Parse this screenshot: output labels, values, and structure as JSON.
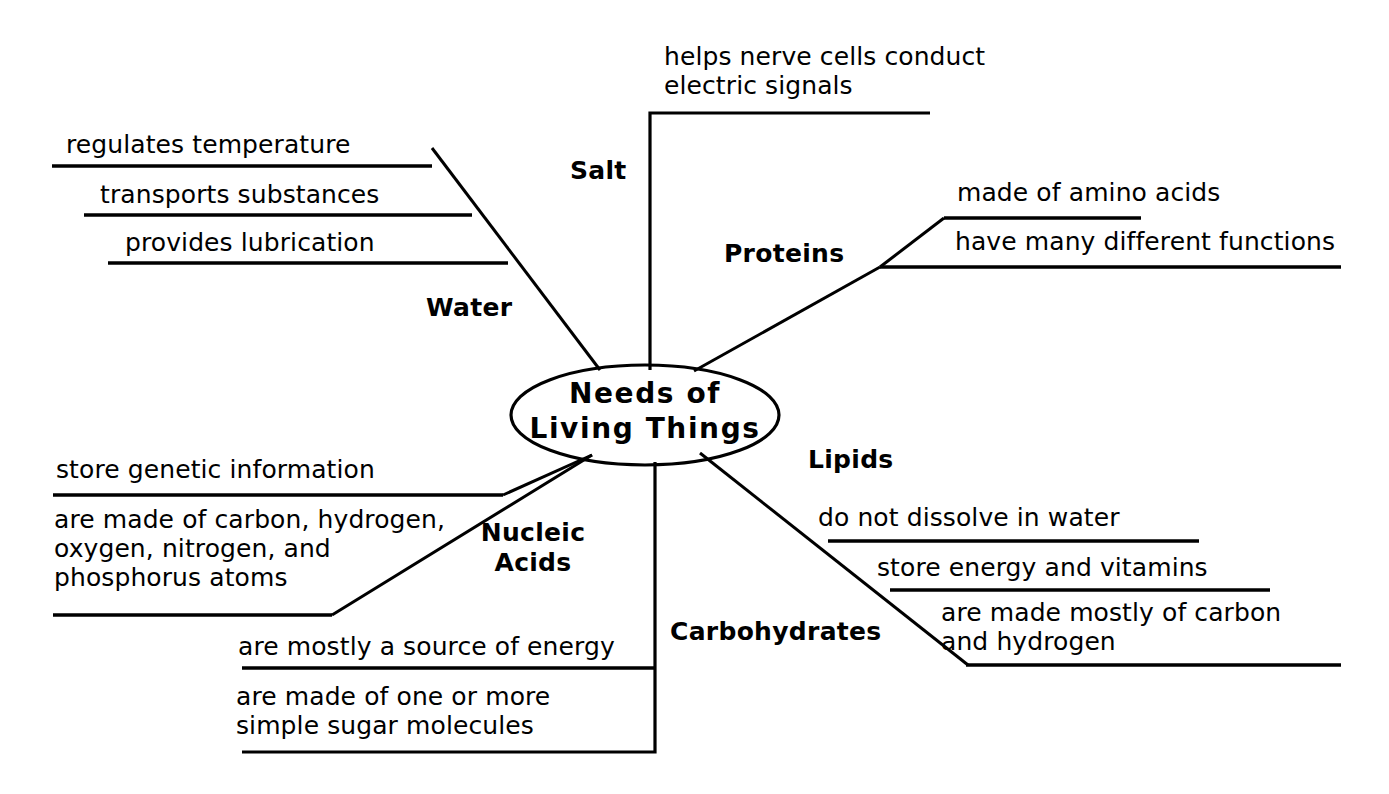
{
  "diagram": {
    "title": "Needs of Living Things",
    "center": {
      "label": "Needs of\nLiving Things"
    },
    "branches": [
      {
        "id": "water",
        "label": "Water",
        "details": [
          "regulates temperature",
          "transports substances",
          "provides lubrication"
        ]
      },
      {
        "id": "salt",
        "label": "Salt",
        "details": [
          "helps nerve cells conduct\nelectric signals"
        ]
      },
      {
        "id": "proteins",
        "label": "Proteins",
        "details": [
          "made of amino acids",
          "have many different functions"
        ]
      },
      {
        "id": "lipids",
        "label": "Lipids",
        "details": [
          "do not dissolve in water",
          "store energy and vitamins",
          "are made mostly of carbon\n  and hydrogen"
        ]
      },
      {
        "id": "carbohydrates",
        "label": "Carbohydrates",
        "details": [
          "are mostly a source of energy",
          "are made of one or more\nsimple sugar molecules"
        ]
      },
      {
        "id": "nucleic-acids",
        "label": "Nucleic\nAcids",
        "details": [
          "store genetic information",
          "are made of carbon, hydrogen,\noxygen, nitrogen, and\nphosphorus atoms"
        ]
      }
    ],
    "colors": {
      "ink": "#000000",
      "paper": "#ffffff"
    }
  }
}
